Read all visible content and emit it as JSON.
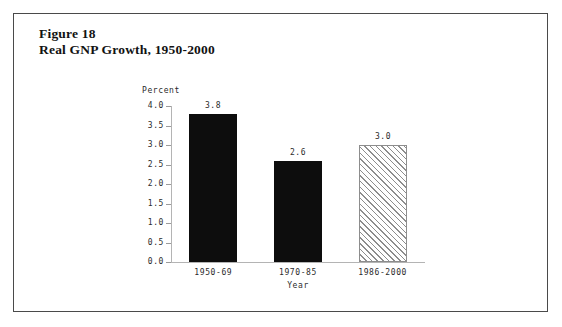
{
  "figure": {
    "caption_line1": "Figure 18",
    "caption_line2": "Real GNP Growth, 1950-2000"
  },
  "chart_data": {
    "type": "bar",
    "title": "Real GNP Growth, 1950-2000",
    "xlabel": "Year",
    "ylabel": "Percent",
    "categories": [
      "1950-69",
      "1970-85",
      "1986-2000"
    ],
    "values": [
      3.8,
      2.6,
      3.0
    ],
    "value_labels": [
      "3.8",
      "2.6",
      "3.0"
    ],
    "ylim": [
      0.0,
      4.0
    ],
    "ytick_labels": [
      "4.0",
      "3.5",
      "3.0",
      "2.5",
      "2.0",
      "1.5",
      "1.0",
      "0.5",
      "0.0"
    ],
    "ytick_values": [
      4.0,
      3.5,
      3.0,
      2.5,
      2.0,
      1.5,
      1.0,
      0.5,
      0.0
    ],
    "grid": false,
    "legend": null,
    "bar_styles": [
      "solid-black",
      "solid-black",
      "diagonal-hatch"
    ],
    "colors": {
      "bar_solid": "#0d0d0d",
      "bar_hatch_line": "#8d8d8d",
      "bar_hatch_fill": "#ffffff",
      "axis": "#b4b4b4",
      "text": "#2b2b2b",
      "frame": "#4a4a4a",
      "background": "#ffffff"
    }
  }
}
